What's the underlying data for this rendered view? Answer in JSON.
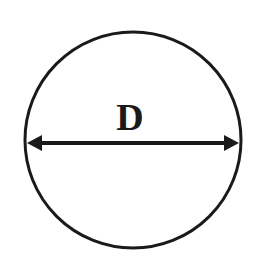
{
  "diagram": {
    "type": "circle-diameter",
    "label": "D",
    "circle": {
      "cx": 133,
      "cy": 140,
      "r": 108,
      "stroke_width": 3
    },
    "diameter_arrow": {
      "x1": 26,
      "x2": 240,
      "y": 143,
      "stroke_width": 4
    },
    "colors": {
      "stroke": "#1a1a1a",
      "background": "#ffffff"
    }
  }
}
